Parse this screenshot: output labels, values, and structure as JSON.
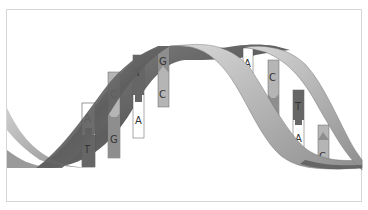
{
  "figure": {
    "colors": {
      "strand_dark": "#6a6a6a",
      "strand_light": "#bdbdbd",
      "base_A": "#ffffff",
      "base_T": "#666666",
      "base_C": "#b4b4b4",
      "base_G": "#8e8e8e",
      "frame": "#d6d6d6"
    },
    "base_pairs": [
      {
        "top": "A",
        "bottom": "T"
      },
      {
        "top": "C",
        "bottom": "G"
      },
      {
        "top": "T",
        "bottom": "A"
      },
      {
        "top": "G",
        "bottom": "C"
      },
      {
        "top": "A",
        "bottom": "T"
      },
      {
        "top": "C",
        "bottom": "G"
      },
      {
        "top": "T",
        "bottom": "A"
      },
      {
        "top": "G",
        "bottom": "C"
      }
    ]
  }
}
